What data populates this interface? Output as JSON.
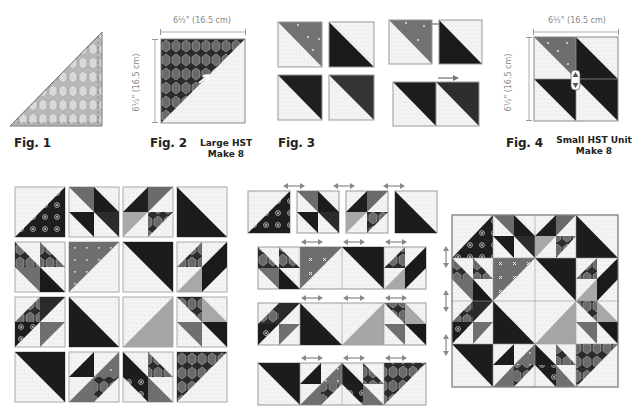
{
  "figures": [
    {
      "id": "fig1",
      "caption": "Fig. 1"
    },
    {
      "id": "fig2",
      "caption": "Fig. 2",
      "subcaption_line1": "Large HST",
      "subcaption_line2": "Make 8",
      "width_label": "6½\" (16.5 cm)",
      "height_label": "6½\" (16.5 cm)"
    },
    {
      "id": "fig3",
      "caption": "Fig. 3"
    },
    {
      "id": "fig4",
      "caption": "Fig. 4",
      "subcaption_line1": "Small HST Unit",
      "subcaption_line2": "Make 8",
      "width_label": "6½\" (16.5 cm)",
      "height_label": "6½\" (16.5 cm)"
    }
  ],
  "colors": {
    "background": "#ffffff",
    "light_fabric": "#f1f1f1",
    "dark_fabric": "#1c1c1c",
    "charcoal_fabric": "#2e2e2e",
    "medium_gray_fabric": "#7a7a7a",
    "light_gray_fabric": "#a9a9a9",
    "print_fabric": "#4a4a4a",
    "seam_line": "#8f8f8f",
    "arrow": "#888888",
    "caption_text": "#222222"
  },
  "icons": {
    "press_arrow_left": "arrow-left-icon",
    "press_arrow_right": "arrow-right-icon",
    "press_arrow_double": "double-arrow-icon",
    "press_arrow_vertical": "vertical-double-arrow-icon"
  },
  "assembly": {
    "block_layout": "4x4 grid of units",
    "rows": 4,
    "cols": 4
  }
}
